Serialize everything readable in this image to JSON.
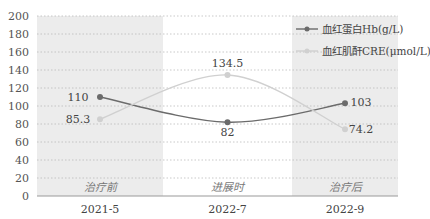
{
  "chart_data": {
    "type": "line",
    "title": "",
    "xlabel": "",
    "ylabel": "",
    "ylim": [
      0,
      200
    ],
    "yticks": [
      0,
      20,
      40,
      60,
      80,
      100,
      120,
      140,
      160,
      180,
      200
    ],
    "grid": true,
    "legend_position": "upper-right",
    "categories": [
      "2021-5",
      "2022-7",
      "2022-9"
    ],
    "bands": [
      "治疗前",
      "进展时",
      "治疗后"
    ],
    "series": [
      {
        "name": "血红蛋白Hb(g/L)",
        "values": [
          110,
          82,
          103
        ],
        "color": "#6b6b6b"
      },
      {
        "name": "血红肌酐CRE(μmol/L)",
        "values": [
          85.3,
          134.5,
          74.2
        ],
        "color": "#d0d0d0"
      }
    ]
  },
  "colors": {
    "band_shaded": "#ececec",
    "band_plain": "#ffffff",
    "grid": "#bbbbbb",
    "axis": "#999999"
  }
}
